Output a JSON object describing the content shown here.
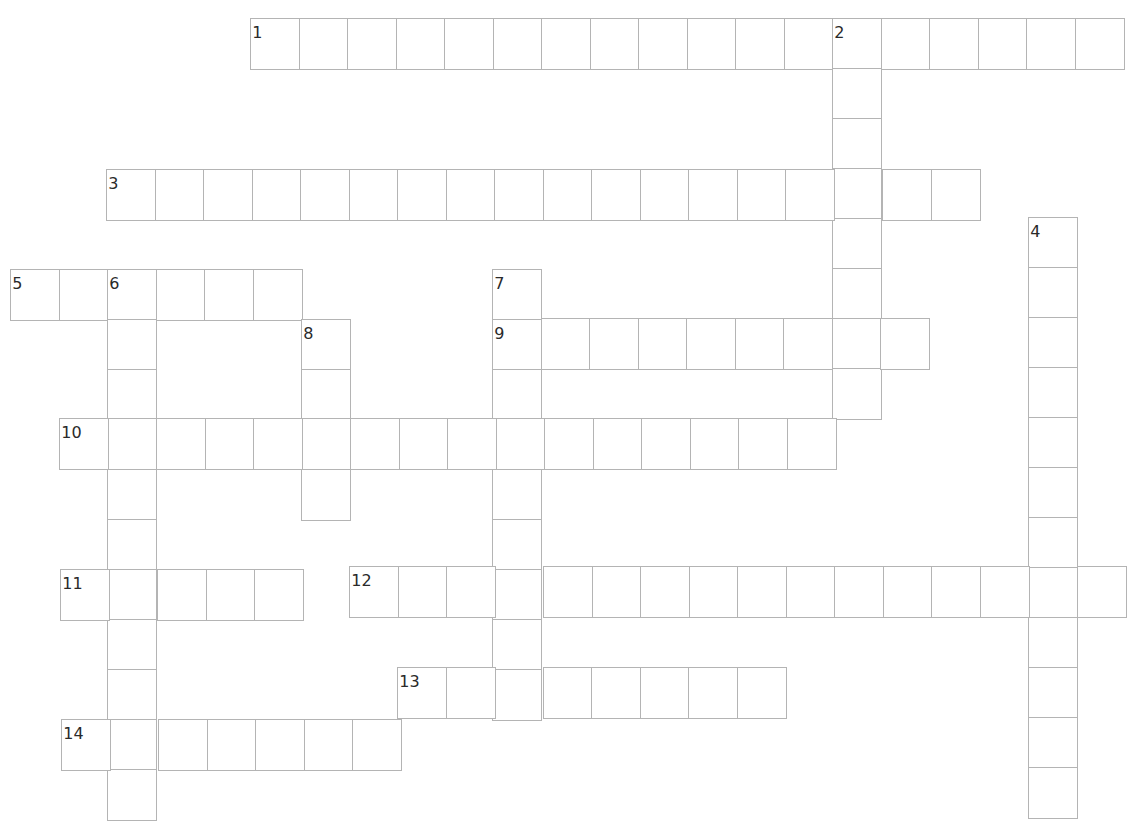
{
  "puzzle": {
    "type": "crossword",
    "cell_size": 48.5,
    "row_height": 50,
    "border_color": "#b4b4b4",
    "number_color": "#2a2a2a",
    "entries": [
      {
        "number": "1",
        "direction": "across",
        "x": 251,
        "y": 19,
        "length": 18
      },
      {
        "number": "2",
        "direction": "down",
        "x": 833,
        "y": 19,
        "length": 8
      },
      {
        "number": "3",
        "direction": "across",
        "x": 107,
        "y": 170,
        "length": 18
      },
      {
        "number": "4",
        "direction": "down",
        "x": 1029,
        "y": 218,
        "length": 12
      },
      {
        "number": "5",
        "direction": "across",
        "x": 11,
        "y": 270,
        "length": 6
      },
      {
        "number": "6",
        "direction": "down",
        "x": 108,
        "y": 270,
        "length": 11
      },
      {
        "number": "7",
        "direction": "down",
        "x": 493,
        "y": 270,
        "length": 9
      },
      {
        "number": "8",
        "direction": "down",
        "x": 302,
        "y": 320,
        "length": 4
      },
      {
        "number": "9",
        "direction": "across",
        "x": 493,
        "y": 319,
        "length": 9
      },
      {
        "number": "10",
        "direction": "across",
        "x": 60,
        "y": 419,
        "length": 16
      },
      {
        "number": "11",
        "direction": "across",
        "x": 61,
        "y": 570,
        "length": 5
      },
      {
        "number": "12",
        "direction": "across",
        "x": 350,
        "y": 567,
        "length": 16
      },
      {
        "number": "13",
        "direction": "across",
        "x": 398,
        "y": 668,
        "length": 8
      },
      {
        "number": "14",
        "direction": "across",
        "x": 62,
        "y": 720,
        "length": 7
      }
    ]
  }
}
